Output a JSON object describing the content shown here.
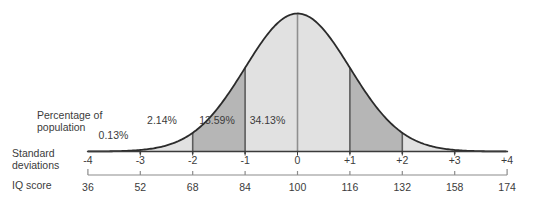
{
  "chart_data": {
    "type": "area",
    "curve_shape": "normal-distribution-bell",
    "annotations": {
      "percentage_label_lines": [
        "Percentage of",
        "population"
      ],
      "segment_percentages": [
        {
          "label": "0.13%",
          "value": 0.13,
          "sd_range": [
            -4,
            -3
          ]
        },
        {
          "label": "2.14%",
          "value": 2.14,
          "sd_range": [
            -3,
            -2
          ]
        },
        {
          "label": "13.59%",
          "value": 13.59,
          "sd_range": [
            -2,
            -1
          ]
        },
        {
          "label": "34.13%",
          "value": 34.13,
          "sd_range": [
            -1,
            0
          ]
        }
      ]
    },
    "axis_sd": {
      "title_lines": [
        "Standard",
        "deviations"
      ],
      "tick_labels": [
        "-4",
        "-3",
        "-2",
        "-1",
        "0",
        "+1",
        "+2",
        "+3",
        "+4"
      ],
      "tick_values": [
        -4,
        -3,
        -2,
        -1,
        0,
        1,
        2,
        3,
        4
      ],
      "range": [
        -4,
        4
      ]
    },
    "axis_iq": {
      "title": "IQ score",
      "tick_labels": [
        "36",
        "52",
        "68",
        "84",
        "100",
        "116",
        "132",
        "158",
        "174"
      ]
    },
    "shaded_regions": [
      {
        "from_sd": -4,
        "to_sd": -2,
        "shade": "light"
      },
      {
        "from_sd": -2,
        "to_sd": -1,
        "shade": "medium"
      },
      {
        "from_sd": -1,
        "to_sd": 1,
        "shade": "light"
      },
      {
        "from_sd": 1,
        "to_sd": 2,
        "shade": "medium"
      },
      {
        "from_sd": 2,
        "to_sd": 4,
        "shade": "light"
      }
    ],
    "colors": {
      "light_fill": "#e1e1e1",
      "medium_fill": "#b6b6b6",
      "curve_stroke": "#2b2b2b",
      "divider_line": "#5c5c5c",
      "center_line": "#8f8f8f",
      "baseline": "#3b3b3b",
      "iq_axis_line": "#8c8c8c",
      "text": "#3b3b3b"
    },
    "grid": false,
    "legend": false
  }
}
